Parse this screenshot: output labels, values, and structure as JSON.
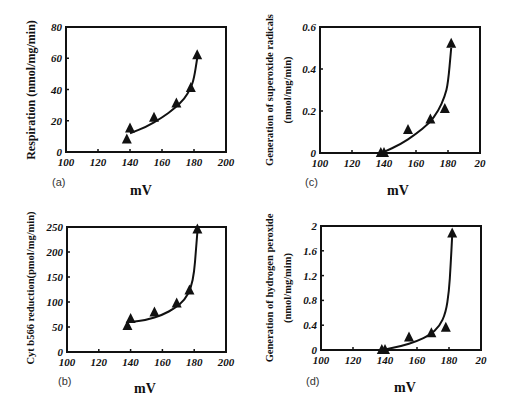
{
  "chart_data": [
    {
      "id": "a",
      "type": "scatter",
      "panel_label": "(a)",
      "xlabel": "mV",
      "ylabel": "Respiration (nmol/mg/min)",
      "xlim": [
        100,
        200
      ],
      "ylim": [
        0,
        80
      ],
      "xticks": [
        100,
        120,
        140,
        160,
        180,
        200
      ],
      "xtick_labels": [
        "100",
        "120",
        "140",
        "160",
        "180",
        "200"
      ],
      "yticks": [
        0,
        20,
        40,
        60,
        80
      ],
      "ytick_labels": [
        "0",
        "20",
        "40",
        "60",
        "80"
      ],
      "grid": false,
      "marker": "triangle",
      "points": [
        {
          "x": 138,
          "y": 8
        },
        {
          "x": 140,
          "y": 15
        },
        {
          "x": 155,
          "y": 22
        },
        {
          "x": 169,
          "y": 31
        },
        {
          "x": 178,
          "y": 41
        },
        {
          "x": 182,
          "y": 62
        }
      ],
      "fit_curve": [
        {
          "x": 140,
          "y": 12
        },
        {
          "x": 150,
          "y": 16
        },
        {
          "x": 160,
          "y": 22
        },
        {
          "x": 168,
          "y": 28
        },
        {
          "x": 174,
          "y": 34
        },
        {
          "x": 178,
          "y": 41
        },
        {
          "x": 180,
          "y": 47
        },
        {
          "x": 182,
          "y": 60
        }
      ],
      "box": {
        "left": 66,
        "top": 27,
        "right": 226,
        "bottom": 152
      }
    },
    {
      "id": "c",
      "type": "scatter",
      "panel_label": "(c)",
      "xlabel": "mV",
      "ylabel": "Generation of superoxide radicals",
      "ylabel2": "(nmol/mg/min)",
      "xlim": [
        100,
        200
      ],
      "ylim": [
        0,
        0.6
      ],
      "xticks": [
        100,
        120,
        140,
        160,
        180,
        200
      ],
      "xtick_labels": [
        "100",
        "120",
        "140",
        "160",
        "180",
        "20"
      ],
      "yticks": [
        0,
        0.2,
        0.4,
        0.6
      ],
      "ytick_labels": [
        "0",
        "0.2",
        "0.4",
        "0.6"
      ],
      "grid": false,
      "marker": "triangle",
      "points": [
        {
          "x": 138,
          "y": 0
        },
        {
          "x": 140,
          "y": 0
        },
        {
          "x": 155,
          "y": 0.11
        },
        {
          "x": 169,
          "y": 0.16
        },
        {
          "x": 178,
          "y": 0.21
        },
        {
          "x": 182,
          "y": 0.52
        }
      ],
      "fit_curve": [
        {
          "x": 140,
          "y": 0.005
        },
        {
          "x": 150,
          "y": 0.04
        },
        {
          "x": 160,
          "y": 0.09
        },
        {
          "x": 168,
          "y": 0.14
        },
        {
          "x": 174,
          "y": 0.2
        },
        {
          "x": 178,
          "y": 0.27
        },
        {
          "x": 180,
          "y": 0.33
        },
        {
          "x": 182,
          "y": 0.5
        }
      ],
      "box": {
        "left": 320,
        "top": 27,
        "right": 480,
        "bottom": 153
      }
    },
    {
      "id": "b",
      "type": "scatter",
      "panel_label": "(b)",
      "xlabel": "mV",
      "ylabel": "Cyt b566 reduction(pmol/mg/min)",
      "xlim": [
        100,
        200
      ],
      "ylim": [
        0,
        250
      ],
      "xticks": [
        100,
        120,
        140,
        160,
        180,
        200
      ],
      "xtick_labels": [
        "100",
        "120",
        "140",
        "160",
        "180",
        "200"
      ],
      "yticks": [
        0,
        50,
        100,
        150,
        200,
        250
      ],
      "ytick_labels": [
        "0",
        "50",
        "100",
        "150",
        "200",
        "250"
      ],
      "grid": false,
      "marker": "triangle",
      "points": [
        {
          "x": 138,
          "y": 52
        },
        {
          "x": 140,
          "y": 66
        },
        {
          "x": 155,
          "y": 79
        },
        {
          "x": 169,
          "y": 97
        },
        {
          "x": 177,
          "y": 123
        },
        {
          "x": 182,
          "y": 245
        }
      ],
      "fit_curve": [
        {
          "x": 140,
          "y": 60
        },
        {
          "x": 150,
          "y": 64
        },
        {
          "x": 160,
          "y": 74
        },
        {
          "x": 168,
          "y": 88
        },
        {
          "x": 174,
          "y": 104
        },
        {
          "x": 178,
          "y": 128
        },
        {
          "x": 180,
          "y": 160
        },
        {
          "x": 181,
          "y": 200
        },
        {
          "x": 182,
          "y": 240
        }
      ],
      "box": {
        "left": 67,
        "top": 227,
        "right": 226,
        "bottom": 352
      }
    },
    {
      "id": "d",
      "type": "scatter",
      "panel_label": "(d)",
      "xlabel": "mV",
      "ylabel": "Generation of hydrogen peroxide",
      "ylabel2": "(nmol/mg/mim)",
      "xlim": [
        100,
        200
      ],
      "ylim": [
        0,
        2
      ],
      "xticks": [
        100,
        120,
        140,
        160,
        180,
        200
      ],
      "xtick_labels": [
        "100",
        "120",
        "140",
        "160",
        "180",
        "20"
      ],
      "yticks": [
        0,
        0.4,
        0.8,
        1.2,
        1.6,
        2
      ],
      "ytick_labels": [
        "0",
        "0.4",
        "0.8",
        "1.2",
        "1.6",
        "2"
      ],
      "grid": false,
      "marker": "triangle",
      "points": [
        {
          "x": 138,
          "y": 0
        },
        {
          "x": 140,
          "y": 0
        },
        {
          "x": 155,
          "y": 0.2
        },
        {
          "x": 169,
          "y": 0.27
        },
        {
          "x": 178,
          "y": 0.36
        },
        {
          "x": 182,
          "y": 1.88
        }
      ],
      "fit_curve": [
        {
          "x": 140,
          "y": 0.01
        },
        {
          "x": 150,
          "y": 0.06
        },
        {
          "x": 160,
          "y": 0.14
        },
        {
          "x": 168,
          "y": 0.24
        },
        {
          "x": 174,
          "y": 0.38
        },
        {
          "x": 178,
          "y": 0.6
        },
        {
          "x": 180,
          "y": 0.95
        },
        {
          "x": 181,
          "y": 1.35
        },
        {
          "x": 182,
          "y": 1.85
        }
      ],
      "box": {
        "left": 321,
        "top": 226,
        "right": 481,
        "bottom": 350
      }
    }
  ]
}
